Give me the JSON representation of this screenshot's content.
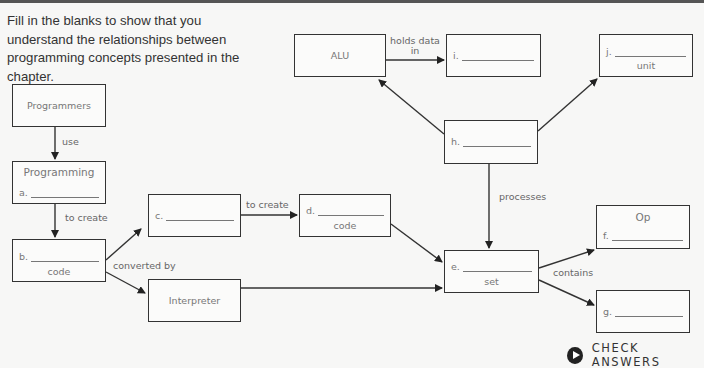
{
  "intro_text": "Fill in the blanks to show that you understand the relationships between programming concepts presented in the chapter.",
  "nodes": {
    "programmers": {
      "title": "Programmers"
    },
    "programming": {
      "title": "Programming",
      "blank_label": "a."
    },
    "b": {
      "blank_label": "b.",
      "sub": "code"
    },
    "c": {
      "blank_label": "c."
    },
    "d": {
      "blank_label": "d.",
      "sub": "code"
    },
    "interpreter": {
      "title": "Interpreter"
    },
    "alu": {
      "title": "ALU"
    },
    "i": {
      "blank_label": "i."
    },
    "j": {
      "blank_label": "j.",
      "sub": "unit"
    },
    "h": {
      "blank_label": "h."
    },
    "e": {
      "blank_label": "e.",
      "sub": "set"
    },
    "f": {
      "title": "Op",
      "blank_label": "f."
    },
    "g": {
      "blank_label": "g."
    }
  },
  "edges": {
    "use": "use",
    "to_create_1": "to create",
    "to_create_2": "to create",
    "converted_by": "converted by",
    "holds_data_in_1": "holds data",
    "holds_data_in_2": "in",
    "processes": "processes",
    "contains": "contains"
  },
  "check_answers": {
    "label": "CHECK ANSWERS",
    "icon": "play-icon"
  }
}
